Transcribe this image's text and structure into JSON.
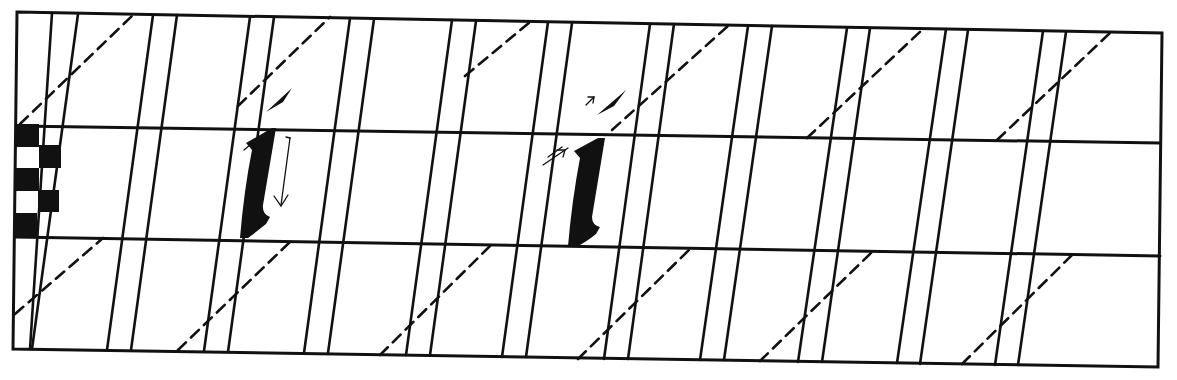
{
  "sheet": {
    "title": "Italic lowercase l calligraphy practice guide",
    "ink_color": "#111111",
    "paper_color": "#ffffff",
    "frame": {
      "tl": [
        17,
        12
      ],
      "tr": [
        1162,
        33
      ],
      "br": [
        1158,
        367
      ],
      "bl": [
        13,
        349
      ]
    },
    "guides": [
      {
        "name": "waistline",
        "from": [
          17,
          126
        ],
        "to": [
          1160,
          143
        ]
      },
      {
        "name": "baseline",
        "from": [
          15,
          237
        ],
        "to": [
          1160,
          256
        ]
      }
    ],
    "slant_line_tops_x": [
      52,
      78,
      153,
      177,
      250,
      274,
      350,
      374,
      452,
      476,
      548,
      572,
      650,
      674,
      748,
      772,
      847,
      870,
      946,
      968,
      1043,
      1066
    ],
    "slant_dx": -46,
    "nib_width_ladder": {
      "squares": 5,
      "label": "pen-width ladder"
    },
    "letters": [
      {
        "glyph": "l",
        "variant": "demonstration with stroke-direction arrow",
        "x": 260
      },
      {
        "glyph": "l",
        "variant": "demonstration with entry arrows",
        "x": 585
      }
    ]
  }
}
